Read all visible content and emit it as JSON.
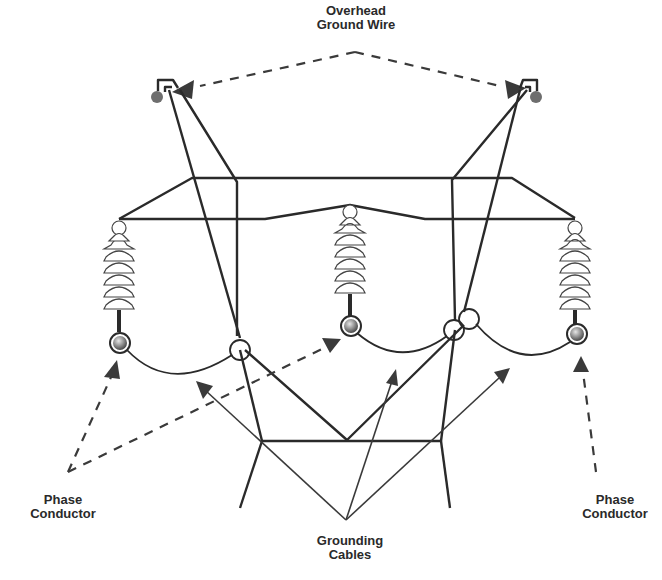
{
  "labels": {
    "overhead_ground_wire": {
      "line1": "Overhead",
      "line2": "Ground Wire"
    },
    "phase_conductor_left": {
      "line1": "Phase",
      "line2": "Conductor"
    },
    "phase_conductor_right": {
      "line1": "Phase",
      "line2": "Conductor"
    },
    "grounding_cables": {
      "line1": "Grounding",
      "line2": "Cables"
    }
  },
  "colors": {
    "line": "#2a2a2a",
    "ground_wire_ball": "#6e6e6e",
    "conductor_ball_light": "#d9d9d9",
    "conductor_ball_dark": "#555555",
    "background": "#ffffff"
  },
  "components": {
    "ground_wires": [
      {
        "name": "left-ground-wire",
        "x": 157,
        "y": 96
      },
      {
        "name": "right-ground-wire",
        "x": 536,
        "y": 96
      }
    ],
    "insulators": [
      {
        "name": "left-insulator",
        "x": 119,
        "top": 228,
        "bottom": 316
      },
      {
        "name": "center-insulator",
        "x": 350,
        "top": 212,
        "bottom": 300
      },
      {
        "name": "right-insulator",
        "x": 575,
        "top": 228,
        "bottom": 316
      }
    ],
    "phase_conductors": [
      {
        "name": "left-phase-conductor",
        "x": 119,
        "y": 343
      },
      {
        "name": "center-phase-conductor",
        "x": 351,
        "y": 326
      },
      {
        "name": "right-phase-conductor",
        "x": 576,
        "y": 334
      }
    ],
    "bond_rings": [
      {
        "x": 240,
        "y": 350
      },
      {
        "x": 454,
        "y": 330
      },
      {
        "x": 469,
        "y": 319
      }
    ]
  }
}
